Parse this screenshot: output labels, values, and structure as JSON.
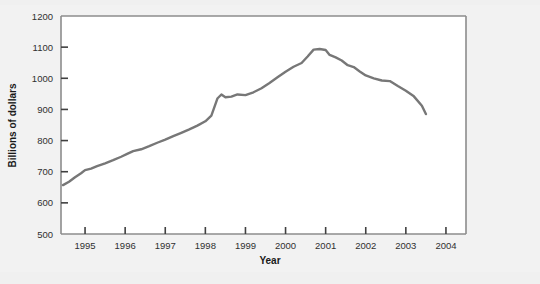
{
  "chart_data": {
    "type": "line",
    "title": "",
    "xlabel": "Year",
    "ylabel": "Billions of dollars",
    "xlim": [
      1994.4,
      2004.5
    ],
    "ylim": [
      500,
      1200
    ],
    "xticks": [
      "1995",
      "1996",
      "1997",
      "1998",
      "1999",
      "2000",
      "2001",
      "2002",
      "2003",
      "2004"
    ],
    "yticks": [
      "500",
      "600",
      "700",
      "800",
      "900",
      "1000",
      "1100",
      "1200"
    ],
    "grid": false,
    "legend": null,
    "line_color": "#777777",
    "background_color": "#f1f1f1",
    "plot_background_color": "#ffffff",
    "axis_color": "#808080",
    "series": [
      {
        "name": "Billions of dollars",
        "x": [
          1994.45,
          1994.6,
          1994.75,
          1994.9,
          1995.0,
          1995.15,
          1995.3,
          1995.5,
          1995.7,
          1995.9,
          1996.05,
          1996.2,
          1996.4,
          1996.6,
          1996.8,
          1997.0,
          1997.2,
          1997.4,
          1997.6,
          1997.8,
          1998.0,
          1998.15,
          1998.3,
          1998.4,
          1998.5,
          1998.65,
          1998.8,
          1999.0,
          1999.2,
          1999.4,
          1999.6,
          1999.8,
          2000.0,
          2000.2,
          2000.4,
          2000.55,
          2000.7,
          2000.85,
          2001.0,
          2001.1,
          2001.25,
          2001.4,
          2001.55,
          2001.7,
          2001.85,
          2002.0,
          2002.2,
          2002.4,
          2002.6,
          2002.8,
          2003.0,
          2003.2,
          2003.4,
          2003.5
        ],
        "y": [
          657,
          668,
          682,
          695,
          705,
          710,
          718,
          727,
          737,
          748,
          757,
          766,
          772,
          782,
          793,
          803,
          814,
          825,
          836,
          848,
          862,
          880,
          935,
          948,
          939,
          941,
          948,
          946,
          955,
          968,
          985,
          1003,
          1021,
          1037,
          1049,
          1070,
          1092,
          1094,
          1091,
          1075,
          1067,
          1057,
          1042,
          1036,
          1022,
          1009,
          1000,
          993,
          991,
          975,
          960,
          942,
          912,
          885
        ]
      }
    ]
  },
  "axis": {
    "ylabel": "Billions of dollars",
    "xlabel": "Year"
  }
}
